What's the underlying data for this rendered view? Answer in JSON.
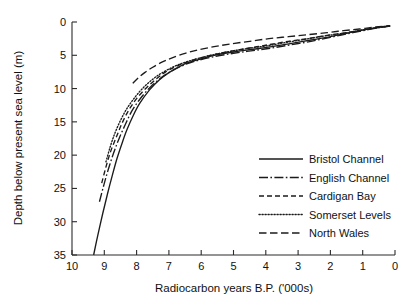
{
  "chart_data": {
    "type": "line",
    "title": "",
    "xlabel": "Radiocarbon years B.P. ('000s)",
    "ylabel": "Depth below present sea level (m)",
    "xlim": [
      10,
      0
    ],
    "ylim": [
      35,
      0
    ],
    "y_inverted": true,
    "x_inverted": true,
    "grid": false,
    "legend_position": "bottom-right",
    "xticks": [
      10,
      9,
      8,
      7,
      6,
      5,
      4,
      3,
      2,
      1,
      0
    ],
    "xticklabels": [
      "10",
      "9",
      "8",
      "7",
      "6",
      "5",
      "4",
      "3",
      "2",
      "1",
      "0"
    ],
    "yticks": [
      0,
      5,
      10,
      15,
      20,
      25,
      30,
      35
    ],
    "yticklabels": [
      "0",
      "5",
      "10",
      "15",
      "20",
      "25",
      "30",
      "35"
    ],
    "series": [
      {
        "name": "Bristol Channel",
        "dash": "none",
        "points": [
          [
            9.33,
            35.0
          ],
          [
            9.2,
            32.0
          ],
          [
            9.05,
            28.8
          ],
          [
            8.9,
            25.8
          ],
          [
            8.75,
            23.0
          ],
          [
            8.6,
            20.4
          ],
          [
            8.45,
            18.2
          ],
          [
            8.3,
            16.2
          ],
          [
            8.1,
            14.0
          ],
          [
            7.9,
            12.2
          ],
          [
            7.6,
            10.2
          ],
          [
            7.3,
            8.7
          ],
          [
            7.0,
            7.6
          ],
          [
            6.6,
            6.5
          ],
          [
            6.2,
            5.8
          ],
          [
            5.6,
            5.0
          ],
          [
            5.0,
            4.5
          ],
          [
            4.4,
            4.1
          ],
          [
            3.8,
            3.7
          ],
          [
            3.2,
            3.2
          ],
          [
            2.6,
            2.7
          ],
          [
            2.0,
            2.2
          ],
          [
            1.5,
            1.7
          ],
          [
            1.0,
            1.2
          ],
          [
            0.5,
            0.8
          ],
          [
            0.15,
            0.6
          ]
        ]
      },
      {
        "name": "English Channel",
        "dash": "dashdot",
        "points": [
          [
            9.15,
            27.0
          ],
          [
            9.02,
            24.6
          ],
          [
            8.88,
            22.2
          ],
          [
            8.72,
            19.8
          ],
          [
            8.55,
            17.6
          ],
          [
            8.35,
            15.4
          ],
          [
            8.15,
            13.4
          ],
          [
            7.9,
            11.6
          ],
          [
            7.6,
            9.9
          ],
          [
            7.3,
            8.6
          ],
          [
            7.0,
            7.6
          ],
          [
            6.6,
            6.6
          ],
          [
            6.2,
            5.9
          ],
          [
            5.6,
            5.2
          ],
          [
            5.0,
            4.7
          ],
          [
            4.4,
            4.3
          ],
          [
            3.8,
            3.9
          ],
          [
            3.2,
            3.4
          ],
          [
            2.6,
            2.9
          ],
          [
            2.0,
            2.3
          ],
          [
            1.5,
            1.8
          ],
          [
            1.0,
            1.3
          ],
          [
            0.5,
            0.85
          ],
          [
            0.15,
            0.62
          ]
        ]
      },
      {
        "name": "Cardigan Bay",
        "dash": "dashed",
        "points": [
          [
            9.08,
            24.2
          ],
          [
            8.95,
            21.8
          ],
          [
            8.8,
            19.4
          ],
          [
            8.62,
            17.2
          ],
          [
            8.45,
            15.2
          ],
          [
            8.25,
            13.3
          ],
          [
            8.0,
            11.5
          ],
          [
            7.7,
            9.9
          ],
          [
            7.4,
            8.6
          ],
          [
            7.1,
            7.5
          ],
          [
            6.7,
            6.5
          ],
          [
            6.3,
            5.8
          ],
          [
            5.7,
            5.0
          ],
          [
            5.1,
            4.4
          ],
          [
            4.5,
            3.9
          ],
          [
            3.9,
            3.4
          ],
          [
            3.3,
            2.9
          ],
          [
            2.7,
            2.5
          ],
          [
            2.1,
            2.0
          ],
          [
            1.5,
            1.6
          ],
          [
            1.0,
            1.2
          ],
          [
            0.5,
            0.8
          ],
          [
            0.15,
            0.58
          ]
        ]
      },
      {
        "name": "Somerset Levels",
        "dash": "dotted",
        "points": [
          [
            8.95,
            21.0
          ],
          [
            8.82,
            18.8
          ],
          [
            8.68,
            16.8
          ],
          [
            8.5,
            14.8
          ],
          [
            8.3,
            13.0
          ],
          [
            8.05,
            11.3
          ],
          [
            7.8,
            9.9
          ],
          [
            7.5,
            8.6
          ],
          [
            7.2,
            7.6
          ],
          [
            6.8,
            6.6
          ],
          [
            6.4,
            5.9
          ],
          [
            5.8,
            5.1
          ],
          [
            5.2,
            4.5
          ],
          [
            4.6,
            4.0
          ],
          [
            4.0,
            3.6
          ],
          [
            3.4,
            3.1
          ],
          [
            2.8,
            2.6
          ],
          [
            2.2,
            2.1
          ],
          [
            1.6,
            1.7
          ],
          [
            1.1,
            1.3
          ],
          [
            0.6,
            0.9
          ],
          [
            0.15,
            0.6
          ]
        ]
      },
      {
        "name": "North Wales",
        "dash": "longdash",
        "points": [
          [
            8.12,
            9.2
          ],
          [
            7.95,
            8.4
          ],
          [
            7.75,
            7.6
          ],
          [
            7.5,
            6.8
          ],
          [
            7.2,
            6.0
          ],
          [
            6.9,
            5.4
          ],
          [
            6.5,
            4.7
          ],
          [
            6.1,
            4.2
          ],
          [
            5.6,
            3.7
          ],
          [
            5.1,
            3.3
          ],
          [
            4.5,
            2.9
          ],
          [
            3.9,
            2.5
          ],
          [
            3.3,
            2.2
          ],
          [
            2.7,
            1.9
          ],
          [
            2.1,
            1.6
          ],
          [
            1.6,
            1.3
          ],
          [
            1.1,
            1.05
          ],
          [
            0.6,
            0.75
          ],
          [
            0.15,
            0.55
          ]
        ]
      }
    ]
  }
}
